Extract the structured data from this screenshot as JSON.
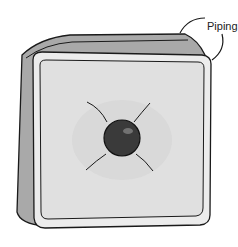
{
  "diagram": {
    "labels": [
      {
        "text": "Piping",
        "points_to": "cushion-edge-piping"
      }
    ],
    "colors": {
      "face": "#e6e6e6",
      "side": "#9a9a9a",
      "outline": "#1a1a1a",
      "button": "#3a3a3a"
    }
  }
}
